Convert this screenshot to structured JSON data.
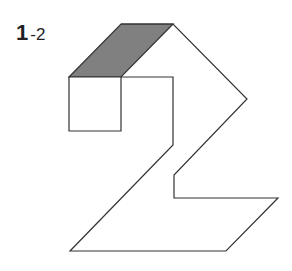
{
  "figure": {
    "label_main": "1",
    "label_sub": "-2",
    "colors": {
      "stroke": "#333333",
      "shade": "#808080",
      "background": "#ffffff"
    },
    "shapes": {
      "top_face": "69,77 121,24 173,24 121,77",
      "front_box": "69,77 121,77 121,131 69,131",
      "outline": "121,24 173,24 247,99 174,175 174,198 278,198 226,251 70,251 173,145 173,77 121,77"
    }
  }
}
